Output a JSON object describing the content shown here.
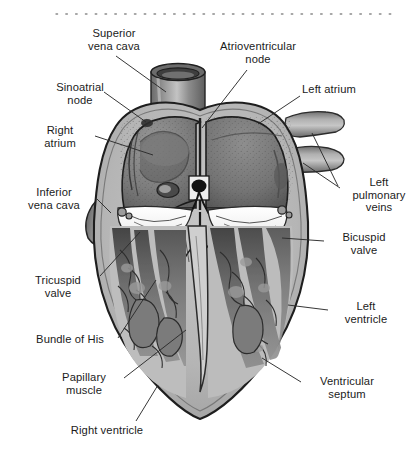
{
  "figure": {
    "top_rule": "dotted-rule",
    "background_color": "#ffffff",
    "ink_color": "#1b1b1b"
  },
  "palette": {
    "myocardium": "#b6b6b6",
    "myocardium_light": "#c9c9c9",
    "chamber_dark": "#6e6e6e",
    "chamber_mid": "#8a8a8a",
    "vessel": "#7e7e7e",
    "vessel_light": "#a9a9a9",
    "valve_white": "#f4f4f4",
    "trabeculae_dark": "#4a4a4a",
    "outline": "#222222",
    "node_black": "#111111"
  },
  "labels": [
    {
      "id": "superior-vena-cava",
      "text": "Superior\nvena cava",
      "align": "center",
      "x": 62,
      "y": 27,
      "w": 104
    },
    {
      "id": "atrioventricular-node",
      "text": "Atrioventricular\nnode",
      "align": "center",
      "x": 200,
      "y": 40,
      "w": 116
    },
    {
      "id": "sinoatrial-node",
      "text": "Sinoatrial\nnode",
      "align": "center",
      "x": 38,
      "y": 81,
      "w": 84
    },
    {
      "id": "left-atrium",
      "text": "Left atrium",
      "align": "left",
      "x": 302,
      "y": 83,
      "w": 92
    },
    {
      "id": "right-atrium",
      "text": "Right\natrium",
      "align": "center",
      "x": 27,
      "y": 124,
      "w": 66
    },
    {
      "id": "inferior-vena-cava",
      "text": "Inferior\nvena cava",
      "align": "center",
      "x": 10,
      "y": 186,
      "w": 88
    },
    {
      "id": "left-pulmonary-veins",
      "text": "Left\npulmonary\nveins",
      "align": "center",
      "x": 340,
      "y": 176,
      "w": 78
    },
    {
      "id": "bicuspid-valve",
      "text": "Bicuspid\nvalve",
      "align": "center",
      "x": 326,
      "y": 231,
      "w": 76
    },
    {
      "id": "tricuspid-valve",
      "text": "Tricuspid\nvalve",
      "align": "center",
      "x": 18,
      "y": 274,
      "w": 80
    },
    {
      "id": "left-ventricle",
      "text": "Left\nventricle",
      "align": "center",
      "x": 330,
      "y": 300,
      "w": 72
    },
    {
      "id": "bundle-of-his",
      "text": "Bundle of His",
      "align": "center",
      "x": 21,
      "y": 333,
      "w": 98
    },
    {
      "id": "papillary-muscle",
      "text": "Papillary\nmuscle",
      "align": "center",
      "x": 45,
      "y": 371,
      "w": 78
    },
    {
      "id": "ventricular-septum",
      "text": "Ventricular\nseptum",
      "align": "center",
      "x": 303,
      "y": 375,
      "w": 88
    },
    {
      "id": "right-ventricle",
      "text": "Right ventricle",
      "align": "center",
      "x": 55,
      "y": 424,
      "w": 104
    }
  ],
  "leader_lines": [
    {
      "id": "leader-superior-vena-cava",
      "points": "116,56 166,92"
    },
    {
      "id": "leader-atrioventricular-node",
      "points": "247,70 202,128"
    },
    {
      "id": "leader-sinoatrial-node",
      "points": "104,92 146,122"
    },
    {
      "id": "leader-left-atrium",
      "points": "300,96 258,124"
    },
    {
      "id": "leader-right-atrium",
      "points": "95,136 153,155"
    },
    {
      "id": "leader-inferior-vena-cava",
      "points": "97,199 111,213"
    },
    {
      "id": "leader-left-pulmonary-veins-a",
      "points": "338,186 312,133"
    },
    {
      "id": "leader-left-pulmonary-veins-b",
      "points": "340,188 303,163"
    },
    {
      "id": "leader-bicuspid-valve",
      "points": "324,241 282,238"
    },
    {
      "id": "leader-tricuspid-valve",
      "points": "100,276 140,232"
    },
    {
      "id": "leader-left-ventricle",
      "points": "328,310 288,305"
    },
    {
      "id": "leader-bundle-of-his",
      "points": "118,338 156,280"
    },
    {
      "id": "leader-papillary-muscle",
      "points": "124,378 186,330"
    },
    {
      "id": "leader-ventricular-septum",
      "points": "301,382 262,358"
    },
    {
      "id": "leader-right-ventricle",
      "points": "136,421 158,385"
    }
  ],
  "anatomy_parts": [
    {
      "id": "superior-vena-cava-vessel",
      "name": "superior vena cava"
    },
    {
      "id": "inferior-vena-cava-vessel",
      "name": "inferior vena cava"
    },
    {
      "id": "left-pulmonary-vein-upper",
      "name": "left pulmonary vein (upper)"
    },
    {
      "id": "left-pulmonary-vein-lower",
      "name": "left pulmonary vein (lower)"
    },
    {
      "id": "right-atrium-chamber",
      "name": "right atrium"
    },
    {
      "id": "left-atrium-chamber",
      "name": "left atrium"
    },
    {
      "id": "right-ventricle-chamber",
      "name": "right ventricle"
    },
    {
      "id": "left-ventricle-chamber",
      "name": "left ventricle"
    },
    {
      "id": "interventricular-septum",
      "name": "ventricular septum"
    },
    {
      "id": "tricuspid-valve-leaflets",
      "name": "tricuspid valve"
    },
    {
      "id": "bicuspid-valve-leaflets",
      "name": "bicuspid (mitral) valve"
    },
    {
      "id": "sinoatrial-node-marker",
      "name": "sinoatrial node"
    },
    {
      "id": "atrioventricular-node-marker",
      "name": "atrioventricular node"
    },
    {
      "id": "bundle-of-his-tract",
      "name": "bundle of His"
    },
    {
      "id": "papillary-muscle-group",
      "name": "papillary muscles"
    },
    {
      "id": "myocardium-wall",
      "name": "myocardium"
    }
  ]
}
